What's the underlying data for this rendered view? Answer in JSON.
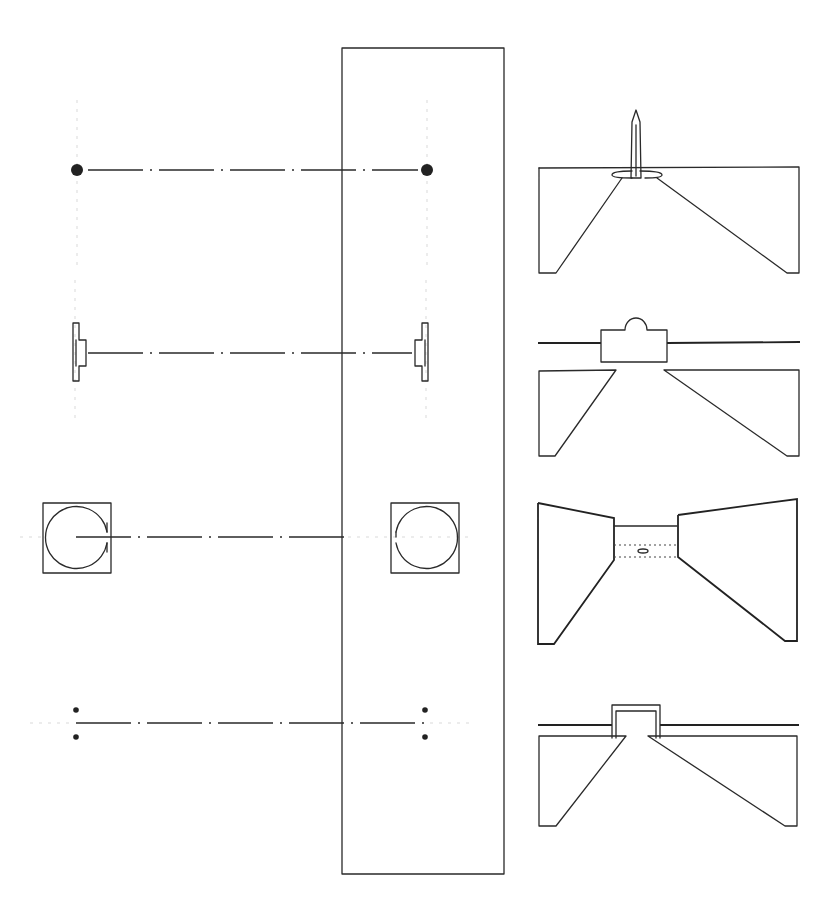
{
  "diagram": {
    "type": "architectural-sketch",
    "ink_color": "#2a2a2a",
    "background": "#ffffff",
    "central_band": {
      "x": 342,
      "y": 48,
      "width": 162,
      "height": 826
    },
    "rows": [
      {
        "id": "row-1",
        "plan": "two-points",
        "axis_y": 170,
        "left_x": 77,
        "right_x": 427,
        "perspective": "obelisk"
      },
      {
        "id": "row-2",
        "plan": "two-walls",
        "axis_y": 353,
        "left_x": 75,
        "right_x": 426,
        "perspective": "domed-pavilion"
      },
      {
        "id": "row-3",
        "plan": "two-enclosed-circles",
        "axis_y": 537,
        "left_x": 44,
        "right_x": 455,
        "perspective": "passage-between-walls"
      },
      {
        "id": "row-4",
        "plan": "paired-points",
        "axis_y": 723,
        "left_x": 76,
        "right_x": 425,
        "perspective": "portal-frame"
      }
    ]
  }
}
